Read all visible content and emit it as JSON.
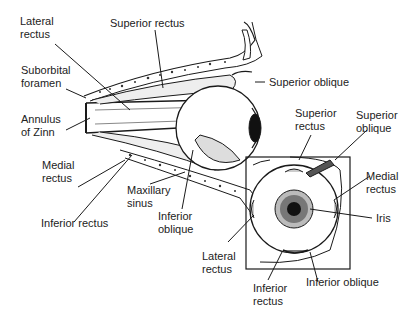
{
  "side_view": {
    "labels": {
      "lateral_rectus_1": "Lateral",
      "lateral_rectus_2": "rectus",
      "superior_rectus": "Superior rectus",
      "suborbital_1": "Suborbital",
      "suborbital_2": "foramen",
      "annulus_1": "Annulus",
      "annulus_2": "of Zinn",
      "superior_oblique": "Superior oblique",
      "medial_rectus_1": "Medial",
      "medial_rectus_2": "rectus",
      "maxillary_1": "Maxillary",
      "maxillary_2": "sinus",
      "inferior_rectus": "Inferior rectus",
      "inferior_oblique_1": "Inferior",
      "inferior_oblique_2": "oblique"
    }
  },
  "front_view": {
    "labels": {
      "superior_rectus_1": "Superior",
      "superior_rectus_2": "rectus",
      "superior_oblique_1": "Superior",
      "superior_oblique_2": "oblique",
      "medial_rectus_1": "Medial",
      "medial_rectus_2": "rectus",
      "iris": "Iris",
      "lateral_rectus_1": "Lateral",
      "lateral_rectus_2": "rectus",
      "inferior_rectus_1": "Inferior",
      "inferior_rectus_2": "rectus",
      "inferior_oblique": "Inferior oblique"
    }
  }
}
